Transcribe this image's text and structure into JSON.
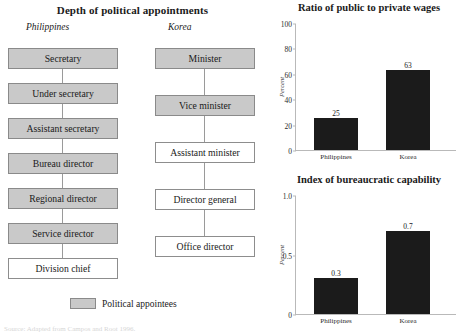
{
  "org_chart": {
    "title": "Depth of political appointments",
    "columns": [
      {
        "heading": "Philippines",
        "nodes": [
          {
            "label": "Secretary",
            "appointee": true
          },
          {
            "label": "Under secretary",
            "appointee": true
          },
          {
            "label": "Assistant secretary",
            "appointee": true
          },
          {
            "label": "Bureau director",
            "appointee": true
          },
          {
            "label": "Regional director",
            "appointee": true
          },
          {
            "label": "Service director",
            "appointee": true
          },
          {
            "label": "Division chief",
            "appointee": false
          }
        ]
      },
      {
        "heading": "Korea",
        "nodes": [
          {
            "label": "Minister",
            "appointee": true
          },
          {
            "label": "Vice minister",
            "appointee": true
          },
          {
            "label": "Assistant minister",
            "appointee": false
          },
          {
            "label": "Director general",
            "appointee": false
          },
          {
            "label": "Office director",
            "appointee": false
          }
        ]
      }
    ],
    "legend": {
      "label": "Political appointees",
      "swatch_color": "#c9c9c9"
    }
  },
  "source_note": "Source: Adapted from Campos and Root 1996.",
  "chart_data": [
    {
      "id": "wages",
      "type": "bar",
      "title": "Ratio of public to private wages",
      "xlabel": "",
      "ylabel": "Percent",
      "categories": [
        "Philippines",
        "Korea"
      ],
      "values": [
        25,
        63
      ],
      "value_labels": [
        "25",
        "63"
      ],
      "ylim": [
        0,
        100
      ],
      "yticks": [
        0,
        20,
        40,
        60,
        80,
        100
      ],
      "ytick_labels": [
        "0",
        "20",
        "40",
        "60",
        "80",
        "100"
      ],
      "grid": false,
      "legend": "none",
      "bar_color": "#1b1b1b"
    },
    {
      "id": "capability",
      "type": "bar",
      "title": "Index of bureaucratic capability",
      "xlabel": "",
      "ylabel": "Percent",
      "categories": [
        "Philippines",
        "Korea"
      ],
      "values": [
        0.3,
        0.7
      ],
      "value_labels": [
        "0.3",
        "0.7"
      ],
      "ylim": [
        0,
        1.0
      ],
      "yticks": [
        0,
        0.5,
        1.0
      ],
      "ytick_labels": [
        "0",
        "0.5",
        "1.0"
      ],
      "grid": false,
      "legend": "none",
      "bar_color": "#1b1b1b"
    }
  ]
}
